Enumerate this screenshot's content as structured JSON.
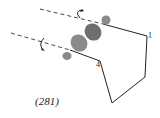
{
  "figure": {
    "caption": "(281)",
    "atom_labels": {
      "a": "1",
      "b": "4"
    },
    "colors": {
      "line": "#222222",
      "lobe_light": "#8a8a8a",
      "lobe_dark": "#6e6e6e",
      "dashed_axis": "#333333"
    },
    "elements": {
      "orbital_lobes": 4,
      "rotation_arrows": 2,
      "dashed_axes": 2
    }
  }
}
